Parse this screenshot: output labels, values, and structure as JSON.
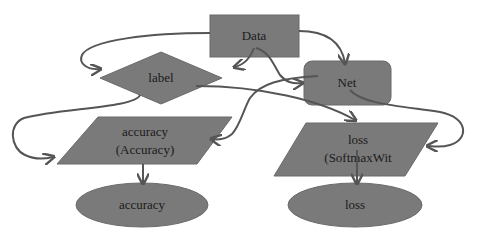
{
  "colors": {
    "node_fill": "#7a7a7a",
    "edge": "#555555",
    "text": "#1a1a1a",
    "background": "#ffffff"
  },
  "nodes": {
    "data": {
      "label": "Data",
      "shape": "rectangle"
    },
    "label": {
      "label": "label",
      "shape": "diamond"
    },
    "net": {
      "label": "Net",
      "shape": "rounded-rectangle"
    },
    "accuracy_layer": {
      "line1": "accuracy",
      "line2": "(Accuracy)",
      "shape": "parallelogram"
    },
    "loss_layer": {
      "line1": "loss",
      "line2": "(SoftmaxWit",
      "shape": "parallelogram"
    },
    "accuracy_out": {
      "label": "accuracy",
      "shape": "ellipse"
    },
    "loss_out": {
      "label": "loss",
      "shape": "ellipse"
    }
  },
  "edges": [
    {
      "from": "Data",
      "to": "label"
    },
    {
      "from": "Data",
      "to": "label"
    },
    {
      "from": "Data",
      "to": "Net"
    },
    {
      "from": "Data",
      "to": "Net"
    },
    {
      "from": "label",
      "to": "accuracy (Accuracy)"
    },
    {
      "from": "label",
      "to": "loss (SoftmaxWit"
    },
    {
      "from": "Net",
      "to": "accuracy (Accuracy)"
    },
    {
      "from": "Net",
      "to": "loss (SoftmaxWit"
    },
    {
      "from": "accuracy (Accuracy)",
      "to": "accuracy"
    },
    {
      "from": "loss (SoftmaxWit",
      "to": "loss"
    }
  ]
}
